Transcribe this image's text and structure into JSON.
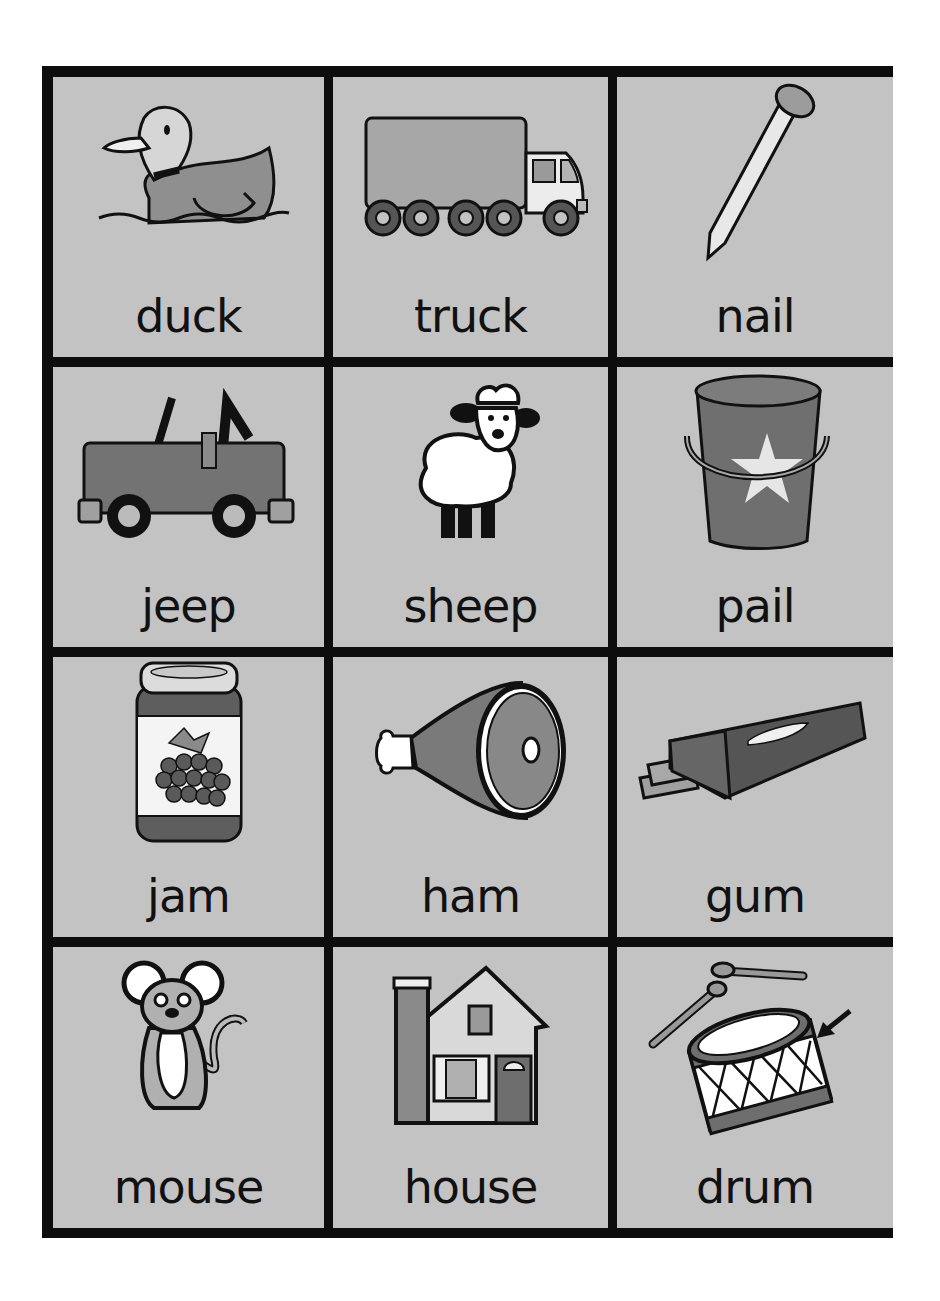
{
  "worksheet": {
    "colors": {
      "frame": "#0d0d0d",
      "card_background": "#c3c3c3",
      "ink": "#111111",
      "dark_fill": "#6e6e6e",
      "mid_fill": "#8f8f8f",
      "light_fill": "#e8e8e8"
    },
    "cards": [
      {
        "word": "duck",
        "picture": "duck-icon"
      },
      {
        "word": "truck",
        "picture": "truck-icon"
      },
      {
        "word": "nail",
        "picture": "nail-icon"
      },
      {
        "word": "jeep",
        "picture": "jeep-icon"
      },
      {
        "word": "sheep",
        "picture": "sheep-icon"
      },
      {
        "word": "pail",
        "picture": "pail-icon"
      },
      {
        "word": "jam",
        "picture": "jam-jar-icon"
      },
      {
        "word": "ham",
        "picture": "ham-icon"
      },
      {
        "word": "gum",
        "picture": "gum-pack-icon"
      },
      {
        "word": "mouse",
        "picture": "mouse-icon"
      },
      {
        "word": "house",
        "picture": "house-icon"
      },
      {
        "word": "drum",
        "picture": "drum-icon"
      }
    ]
  }
}
